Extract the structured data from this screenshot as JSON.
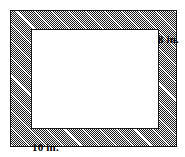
{
  "figure": {
    "type": "geometry-diagram",
    "shape_name": "rectangular-frame",
    "inner_region": {
      "name": "inner-rectangle",
      "fill": "#ffffff"
    },
    "border_region": {
      "name": "hatched-border",
      "fill_pattern": "cross-hatch",
      "fill_color": "#8a8a8a",
      "outline_color": "#1a1a1a"
    },
    "labels": {
      "height": "8 in.",
      "width": "10 in."
    },
    "dimensions": {
      "height_value": 8,
      "width_value": 10,
      "units": "in."
    }
  }
}
